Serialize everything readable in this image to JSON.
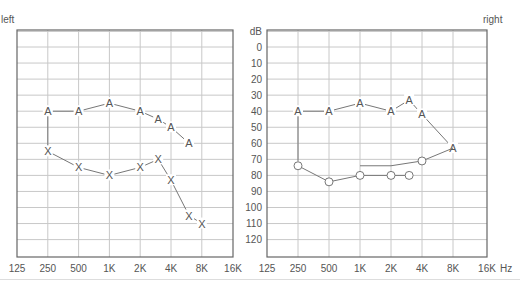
{
  "chart_data": [
    {
      "type": "line",
      "title": "left",
      "xlabel": "",
      "ylabel": "dB",
      "x_ticks": [
        "125",
        "250",
        "500",
        "1K",
        "2K",
        "4K",
        "8K",
        "16K"
      ],
      "y_ticks": [
        0,
        10,
        20,
        30,
        40,
        50,
        60,
        70,
        80,
        90,
        100,
        110,
        120
      ],
      "ylim": [
        -10,
        130
      ],
      "y_inverted": true,
      "grid": true,
      "series": [
        {
          "name": "A",
          "marker": "A",
          "x": [
            "250",
            "500",
            "1K",
            "2K",
            "3K",
            "4K",
            "6K"
          ],
          "values": [
            40,
            40,
            35,
            40,
            45,
            50,
            60
          ]
        },
        {
          "name": "X",
          "marker": "X",
          "x": [
            "250",
            "500",
            "1K",
            "2K",
            "3K",
            "4K",
            "6K",
            "8K"
          ],
          "values": [
            65,
            75,
            80,
            75,
            70,
            83,
            105,
            110
          ]
        }
      ],
      "connector": {
        "x": "250",
        "from": 40,
        "to": 65
      }
    },
    {
      "type": "line",
      "title": "right",
      "xlabel": "Hz",
      "ylabel": "dB",
      "x_ticks": [
        "125",
        "250",
        "500",
        "1K",
        "2K",
        "4K",
        "8K",
        "16K"
      ],
      "y_ticks": [
        0,
        10,
        20,
        30,
        40,
        50,
        60,
        70,
        80,
        90,
        100,
        110,
        120
      ],
      "ylim": [
        -10,
        130
      ],
      "y_inverted": true,
      "grid": true,
      "series": [
        {
          "name": "A",
          "marker": "A",
          "x": [
            "250",
            "500",
            "1K",
            "2K",
            "3K",
            "4K",
            "8K"
          ],
          "values": [
            40,
            40,
            35,
            40,
            33,
            42,
            63
          ]
        },
        {
          "name": "O",
          "marker": "O",
          "x": [
            "250",
            "500",
            "1K",
            "2K",
            "3K"
          ],
          "values": [
            74,
            84,
            80,
            80,
            80
          ]
        },
        {
          "name": "O-high",
          "marker": "O",
          "x": [
            "1K",
            "2K",
            "4K",
            "8K"
          ],
          "values": [
            74,
            74,
            71,
            63
          ],
          "markers_at": [
            "4K"
          ]
        }
      ],
      "connector": {
        "x": "250",
        "from": 40,
        "to": 74
      }
    }
  ],
  "labels": {
    "left_title": "left",
    "right_title": "right",
    "db_unit": "dB",
    "hz_unit": "Hz"
  },
  "colors": {
    "grid": "#c8c8c8",
    "frame": "#666666",
    "line": "#777777",
    "text": "#555555"
  }
}
